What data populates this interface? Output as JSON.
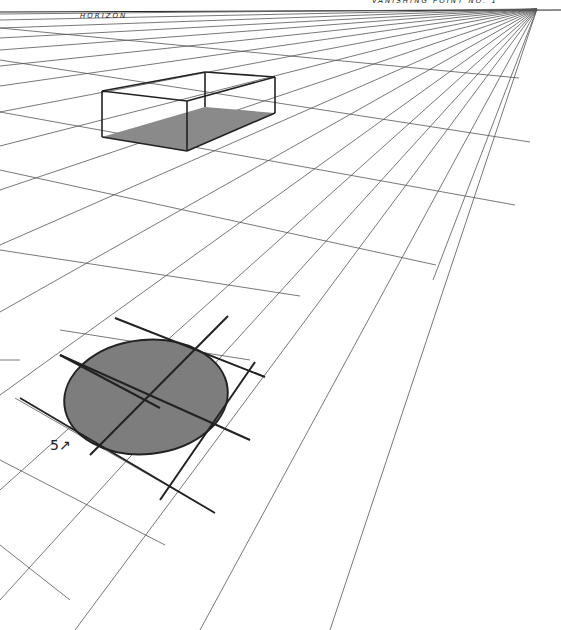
{
  "labels": {
    "horizon": "HORIZON",
    "vanishing_point": "VANISHING POINT NO. 1",
    "step": "5↗"
  },
  "colors": {
    "paper": "#ffffff",
    "pencil": "#555555",
    "dark": "#222222",
    "shade": "#8a8a8a"
  },
  "drawing": {
    "horizon_y": 10,
    "vanishing_point": [
      537,
      9
    ],
    "converging_line_ends": [
      [
        0,
        14
      ],
      [
        0,
        20
      ],
      [
        0,
        28
      ],
      [
        0,
        38
      ],
      [
        0,
        50
      ],
      [
        0,
        66
      ],
      [
        0,
        86
      ],
      [
        0,
        112
      ],
      [
        0,
        146
      ],
      [
        0,
        190
      ],
      [
        0,
        245
      ],
      [
        0,
        312
      ],
      [
        0,
        395
      ],
      [
        0,
        490
      ],
      [
        0,
        600
      ],
      [
        75,
        630
      ],
      [
        200,
        630
      ],
      [
        330,
        630
      ],
      [
        433,
        280
      ]
    ],
    "cross_lines": [
      [
        [
          0,
          28
        ],
        [
          519,
          78
        ]
      ],
      [
        [
          0,
          60
        ],
        [
          530,
          142
        ]
      ],
      [
        [
          0,
          112
        ],
        [
          515,
          205
        ]
      ],
      [
        [
          0,
          170
        ],
        [
          436,
          265
        ]
      ],
      [
        [
          0,
          250
        ],
        [
          300,
          296
        ]
      ],
      [
        [
          60,
          330
        ],
        [
          250,
          360
        ]
      ],
      [
        [
          0,
          360
        ],
        [
          20,
          360
        ]
      ],
      [
        [
          115,
          318
        ],
        [
          265,
          377
        ]
      ],
      [
        [
          60,
          355
        ],
        [
          250,
          440
        ]
      ],
      [
        [
          15,
          398
        ],
        [
          215,
          513
        ]
      ],
      [
        [
          0,
          460
        ],
        [
          165,
          545
        ]
      ],
      [
        [
          0,
          545
        ],
        [
          70,
          600
        ]
      ]
    ],
    "box": {
      "top": [
        [
          102,
          91
        ],
        [
          187,
          101
        ],
        [
          275,
          77
        ],
        [
          205,
          72
        ]
      ],
      "bottom": [
        [
          102,
          137
        ],
        [
          187,
          151
        ],
        [
          275,
          113
        ],
        [
          205,
          107
        ]
      ]
    },
    "circle": {
      "cx": 146,
      "cy": 397,
      "rx": 82,
      "ry": 57,
      "rotate": -6
    }
  }
}
